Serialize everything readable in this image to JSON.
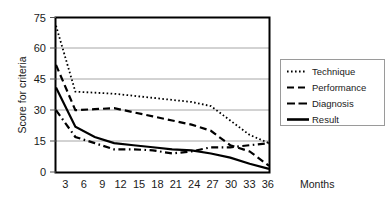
{
  "chart_data": {
    "type": "line",
    "title": "",
    "xlabel": "Months",
    "ylabel": "Score for criteria",
    "categories": [
      3,
      6,
      9,
      12,
      15,
      18,
      21,
      24,
      27,
      30,
      33,
      36
    ],
    "x": [
      3,
      6,
      9,
      12,
      15,
      18,
      21,
      24,
      27,
      30,
      33,
      36
    ],
    "xlim": [
      3,
      36
    ],
    "ylim": [
      0,
      75
    ],
    "yticks": [
      0,
      15,
      30,
      45,
      60,
      75
    ],
    "xticks": [
      3,
      6,
      9,
      12,
      15,
      18,
      21,
      24,
      27,
      30,
      33,
      36
    ],
    "grid": "horizontal",
    "legend_position": "right",
    "series": [
      {
        "name": "Technique",
        "style": "dotted",
        "values": [
          71,
          39,
          38.5,
          38,
          37,
          36,
          35,
          34,
          32,
          25,
          18,
          14
        ]
      },
      {
        "name": "Performance",
        "style": "dashed",
        "values": [
          52,
          30,
          30.5,
          31,
          29,
          27,
          25,
          23,
          20,
          13,
          10,
          3
        ]
      },
      {
        "name": "Diagnosis",
        "style": "dash-dot",
        "values": [
          30,
          17,
          14,
          11,
          11,
          10.5,
          9,
          10,
          12,
          12,
          13,
          14
        ]
      },
      {
        "name": "Result",
        "style": "solid",
        "values": [
          41,
          22,
          17,
          14,
          13,
          12,
          11,
          10.5,
          9,
          7,
          4,
          1.5
        ]
      }
    ]
  },
  "axes": {
    "y_tick_labels": [
      "75",
      "60",
      "45",
      "30",
      "15",
      "0"
    ],
    "x_tick_labels": [
      "3",
      "6",
      "9",
      "12",
      "15",
      "18",
      "21",
      "24",
      "27",
      "30",
      "33",
      "36"
    ],
    "y_axis_title": "Score for criteria",
    "x_axis_title": "Months"
  },
  "legend": {
    "items": [
      {
        "label": "Technique",
        "style": "dotted"
      },
      {
        "label": "Performance",
        "style": "dashed"
      },
      {
        "label": "Diagnosis",
        "style": "dash-dot"
      },
      {
        "label": "Result",
        "style": "solid"
      }
    ]
  },
  "colors": {
    "line": "#000000",
    "grid": "#a6a6a6",
    "frame": "#000000",
    "background": "#ffffff",
    "legend_border": "#9a9a9a"
  }
}
